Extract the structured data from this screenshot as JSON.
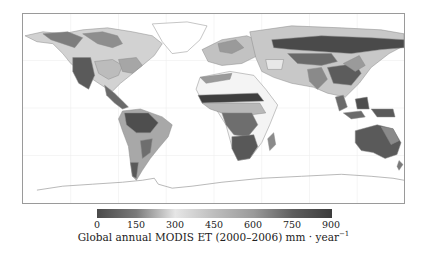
{
  "figure": {
    "caption_main": "Global annual MODIS ET (2000–2006) mm · year",
    "caption_exponent": "−1"
  },
  "colorbar": {
    "ticks": [
      "0",
      "150",
      "300",
      "450",
      "600",
      "750",
      "900"
    ],
    "min": 0,
    "max": 900,
    "unit": "mm · year−1",
    "gradient_stops": [
      {
        "value": 0,
        "color": "#4a4a4a"
      },
      {
        "value": 150,
        "color": "#7a7a7a"
      },
      {
        "value": 300,
        "color": "#e6e6e6"
      },
      {
        "value": 450,
        "color": "#bdbdbd"
      },
      {
        "value": 600,
        "color": "#9a9a9a"
      },
      {
        "value": 750,
        "color": "#5e5e5e"
      },
      {
        "value": 900,
        "color": "#3c3c3c"
      }
    ]
  },
  "map": {
    "projection": "equirectangular world map",
    "variable": "Global annual MODIS ET (2000–2006)",
    "gridlines": true,
    "colors": {
      "frame": "#9a9a9a",
      "gridline": "#ececec",
      "coastline": "#8a8a8a"
    }
  }
}
